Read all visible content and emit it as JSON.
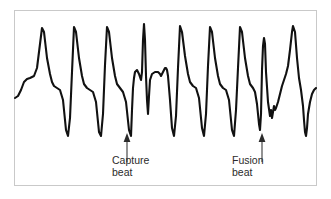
{
  "figure": {
    "kind": "ecg-rhythm-strip",
    "frame": {
      "border_color": "#c9c9c9",
      "background_color": "#ffffff"
    },
    "trace": {
      "color": "#111111",
      "stroke_width": 2.1
    }
  },
  "annotations": [
    {
      "id": "capture",
      "name": "capture-beat",
      "line1": "Capture",
      "line2": "beat",
      "arrow_color": "#3a3a3a",
      "points_to_beat_index": 4
    },
    {
      "id": "fusion",
      "name": "fusion-beat",
      "line1": "Fusion",
      "line2": "beat",
      "arrow_color": "#3a3a3a",
      "points_to_beat_index": 8
    }
  ],
  "chart_data": {
    "type": "line",
    "title": "",
    "xlabel": "",
    "ylabel": "",
    "grid": false,
    "legend": null,
    "axis_visible": false,
    "xlim": [
      0,
      303
    ],
    "ylim": [
      0,
      176
    ],
    "y_axis_inverted": true,
    "beats": [
      {
        "index": 1,
        "type": "wide-qrs",
        "peak_x": 28,
        "peak_y": 18,
        "trough_y": 126
      },
      {
        "index": 2,
        "type": "wide-qrs",
        "peak_x": 60,
        "peak_y": 17,
        "trough_y": 126
      },
      {
        "index": 3,
        "type": "wide-qrs",
        "peak_x": 93,
        "peak_y": 17,
        "trough_y": 126
      },
      {
        "index": 4,
        "type": "capture-beat",
        "peak_x": 120,
        "peak_y": 14,
        "trough_y": 104,
        "narrow": true
      },
      {
        "index": 5,
        "type": "wide-qrs",
        "peak_x": 148,
        "peak_y": 16,
        "trough_y": 126
      },
      {
        "index": 6,
        "type": "wide-qrs",
        "peak_x": 179,
        "peak_y": 17,
        "trough_y": 126
      },
      {
        "index": 7,
        "type": "wide-qrs",
        "peak_x": 211,
        "peak_y": 17,
        "trough_y": 126
      },
      {
        "index": 8,
        "type": "fusion-beat",
        "peak_x": 236,
        "peak_y": 28,
        "trough_y": 108,
        "notched": true
      },
      {
        "index": 9,
        "type": "wide-qrs",
        "peak_x": 266,
        "peak_y": 16,
        "trough_y": 126
      }
    ],
    "path_points": [
      [
        1,
        88
      ],
      [
        4,
        86
      ],
      [
        7,
        80
      ],
      [
        10,
        72
      ],
      [
        13,
        69
      ],
      [
        16,
        68
      ],
      [
        20,
        66
      ],
      [
        23,
        58
      ],
      [
        26,
        34
      ],
      [
        28,
        18
      ],
      [
        30,
        22
      ],
      [
        33,
        48
      ],
      [
        36,
        64
      ],
      [
        38,
        72
      ],
      [
        40,
        76
      ],
      [
        43,
        78
      ],
      [
        46,
        80
      ],
      [
        49,
        90
      ],
      [
        52,
        120
      ],
      [
        54,
        126
      ],
      [
        56,
        108
      ],
      [
        58,
        62
      ],
      [
        60,
        17
      ],
      [
        62,
        22
      ],
      [
        65,
        48
      ],
      [
        68,
        66
      ],
      [
        70,
        74
      ],
      [
        73,
        78
      ],
      [
        76,
        80
      ],
      [
        79,
        82
      ],
      [
        82,
        92
      ],
      [
        85,
        122
      ],
      [
        87,
        126
      ],
      [
        89,
        104
      ],
      [
        91,
        55
      ],
      [
        93,
        17
      ],
      [
        95,
        22
      ],
      [
        98,
        48
      ],
      [
        101,
        66
      ],
      [
        103,
        74
      ],
      [
        106,
        78
      ],
      [
        109,
        82
      ],
      [
        112,
        92
      ],
      [
        115,
        120
      ],
      [
        117,
        126
      ],
      [
        118,
        100
      ],
      [
        119,
        78
      ],
      [
        120,
        68
      ],
      [
        121,
        62
      ],
      [
        123,
        60
      ],
      [
        125,
        64
      ],
      [
        127,
        70
      ],
      [
        128,
        62
      ],
      [
        129,
        30
      ],
      [
        130,
        14
      ],
      [
        131,
        30
      ],
      [
        132,
        66
      ],
      [
        133,
        90
      ],
      [
        134,
        104
      ],
      [
        135,
        86
      ],
      [
        136,
        70
      ],
      [
        138,
        64
      ],
      [
        141,
        62
      ],
      [
        144,
        62
      ],
      [
        146,
        64
      ],
      [
        147,
        66
      ],
      [
        148,
        64
      ],
      [
        149,
        62
      ],
      [
        150,
        60
      ],
      [
        151,
        58
      ],
      [
        152,
        58
      ],
      [
        153,
        60
      ],
      [
        154,
        66
      ],
      [
        156,
        90
      ],
      [
        158,
        118
      ],
      [
        160,
        126
      ],
      [
        162,
        106
      ],
      [
        164,
        58
      ],
      [
        166,
        16
      ],
      [
        168,
        22
      ],
      [
        171,
        46
      ],
      [
        174,
        64
      ],
      [
        176,
        72
      ],
      [
        179,
        76
      ],
      [
        182,
        78
      ],
      [
        185,
        88
      ],
      [
        188,
        118
      ],
      [
        190,
        126
      ],
      [
        192,
        104
      ],
      [
        194,
        56
      ],
      [
        196,
        17
      ],
      [
        198,
        22
      ],
      [
        201,
        48
      ],
      [
        204,
        66
      ],
      [
        206,
        74
      ],
      [
        209,
        78
      ],
      [
        212,
        80
      ],
      [
        215,
        90
      ],
      [
        218,
        120
      ],
      [
        220,
        126
      ],
      [
        222,
        100
      ],
      [
        224,
        58
      ],
      [
        226,
        17
      ],
      [
        228,
        22
      ],
      [
        231,
        48
      ],
      [
        234,
        66
      ],
      [
        236,
        74
      ],
      [
        239,
        78
      ],
      [
        241,
        82
      ],
      [
        243,
        94
      ],
      [
        245,
        114
      ],
      [
        246,
        120
      ],
      [
        247,
        104
      ],
      [
        248,
        60
      ],
      [
        249,
        36
      ],
      [
        250,
        28
      ],
      [
        251,
        34
      ],
      [
        252,
        62
      ],
      [
        254,
        92
      ],
      [
        256,
        106
      ],
      [
        257,
        100
      ],
      [
        258,
        108
      ],
      [
        259,
        102
      ],
      [
        260,
        96
      ],
      [
        261,
        100
      ],
      [
        262,
        98
      ],
      [
        264,
        92
      ],
      [
        266,
        84
      ],
      [
        268,
        76
      ],
      [
        270,
        70
      ],
      [
        272,
        64
      ],
      [
        274,
        56
      ],
      [
        276,
        40
      ],
      [
        278,
        22
      ],
      [
        279,
        16
      ],
      [
        281,
        22
      ],
      [
        283,
        48
      ],
      [
        285,
        68
      ],
      [
        287,
        80
      ],
      [
        288,
        88
      ],
      [
        289,
        96
      ],
      [
        290,
        110
      ],
      [
        291,
        122
      ],
      [
        292,
        126
      ],
      [
        293,
        118
      ],
      [
        294,
        104
      ],
      [
        296,
        92
      ],
      [
        298,
        84
      ],
      [
        300,
        80
      ],
      [
        302,
        78
      ]
    ]
  }
}
